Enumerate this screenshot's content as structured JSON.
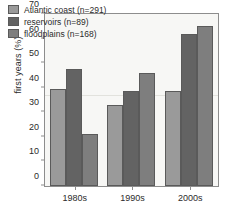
{
  "chart_data": {
    "type": "bar",
    "title": "",
    "xlabel": "",
    "ylabel": "first years (%)",
    "ylim": [
      0,
      70
    ],
    "yticks": [
      0,
      10,
      20,
      30,
      40,
      50,
      60,
      70
    ],
    "grid": false,
    "legend_position": "top-left",
    "categories": [
      "1980s",
      "1990s",
      "2000s"
    ],
    "series": [
      {
        "name": "Atlantic coast (n=291)",
        "values": [
          39.5,
          33.0,
          38.5
        ],
        "color": "#9a9a9a"
      },
      {
        "name": "reservoirs (n=89)",
        "values": [
          47.5,
          38.5,
          62.0
        ],
        "color": "#636363"
      },
      {
        "name": "floodplains (n=168)",
        "values": [
          21.0,
          46.0,
          65.0
        ],
        "color": "#7e7e7e"
      }
    ]
  },
  "legend": {
    "items": [
      {
        "label": "Atlantic coast (n=291)"
      },
      {
        "label": "reservoirs (n=89)"
      },
      {
        "label": "floodplains (n=168)"
      }
    ]
  }
}
